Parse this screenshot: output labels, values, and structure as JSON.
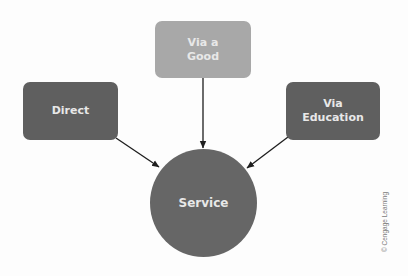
{
  "diagram": {
    "nodes": {
      "via_good": {
        "label": "Via a\nGood",
        "color": "#a8a8a8"
      },
      "direct": {
        "label": "Direct",
        "color": "#5f5f5f"
      },
      "via_education": {
        "label": "Via\nEducation",
        "color": "#5f5f5f"
      },
      "service": {
        "label": "Service",
        "color": "#666666"
      }
    },
    "edges": [
      {
        "from": "direct",
        "to": "service"
      },
      {
        "from": "via_good",
        "to": "service"
      },
      {
        "from": "via_education",
        "to": "service"
      }
    ],
    "credit": "© Cengage Learning"
  }
}
